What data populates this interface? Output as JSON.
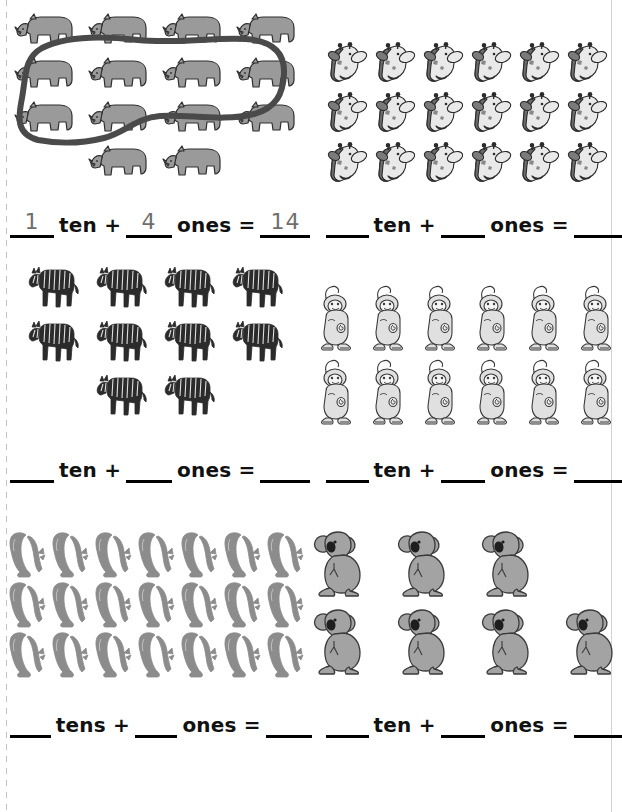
{
  "worksheet": {
    "title": "Tens and Ones counting worksheet",
    "colors": {
      "ink": "#000000",
      "pencil_answer": "#6e6e6e",
      "loop_stroke": "#4a4a4a",
      "rhino_fill": "#9a9a9a",
      "zebra_fill": "#2b2b2b",
      "giraffe_fill": "#e9e9e9",
      "monkey_fill": "#e0e0e0",
      "seal_fill": "#8c8c8c",
      "koala_fill": "#a3a3a3"
    }
  },
  "problems": [
    {
      "id": "problem-1",
      "animal": "rhino",
      "icon": "rhino-icon",
      "rows": [
        4,
        4,
        4,
        2
      ],
      "total": 14,
      "grouped": true,
      "group_circled_count": 10,
      "equation": {
        "tens_value": "1",
        "tens_word": "ten +",
        "ones_value": "4",
        "ones_word": "ones =",
        "result_value": "14"
      }
    },
    {
      "id": "problem-2",
      "animal": "giraffe",
      "icon": "giraffe-head-icon",
      "rows": [
        6,
        6,
        6
      ],
      "total": 18,
      "grouped": false,
      "equation": {
        "tens_value": "",
        "tens_word": "ten +",
        "ones_value": "",
        "ones_word": "ones =",
        "result_value": ""
      }
    },
    {
      "id": "problem-3",
      "animal": "zebra",
      "icon": "zebra-icon",
      "rows": [
        4,
        4,
        2
      ],
      "total": 10,
      "grouped": false,
      "equation": {
        "tens_value": "",
        "tens_word": "ten +",
        "ones_value": "",
        "ones_word": "ones =",
        "result_value": ""
      }
    },
    {
      "id": "problem-4",
      "animal": "monkey",
      "icon": "monkey-icon",
      "rows": [
        6,
        6
      ],
      "total": 12,
      "grouped": false,
      "equation": {
        "tens_value": "",
        "tens_word": "ten +",
        "ones_value": "",
        "ones_word": "ones =",
        "result_value": ""
      }
    },
    {
      "id": "problem-5",
      "animal": "seal",
      "icon": "seal-icon",
      "rows": [
        7,
        7,
        7
      ],
      "total": 21,
      "grouped": false,
      "equation": {
        "tens_value": "",
        "tens_word": "tens +",
        "ones_value": "",
        "ones_word": "ones =",
        "result_value": ""
      }
    },
    {
      "id": "problem-6",
      "animal": "koala",
      "icon": "koala-icon",
      "rows": [
        3,
        4
      ],
      "total": 7,
      "grouped": false,
      "equation": {
        "tens_value": "",
        "tens_word": "ten +",
        "ones_value": "",
        "ones_word": "ones =",
        "result_value": ""
      }
    }
  ]
}
